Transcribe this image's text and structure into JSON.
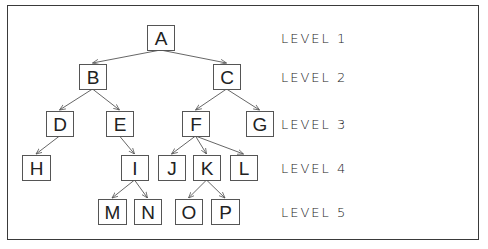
{
  "diagram": {
    "type": "tree",
    "nodes": [
      {
        "id": "A",
        "label": "A",
        "level": 1,
        "x": 147,
        "y": 25,
        "w": 27,
        "h": 25
      },
      {
        "id": "B",
        "label": "B",
        "level": 2,
        "x": 79,
        "y": 64,
        "w": 27,
        "h": 25
      },
      {
        "id": "C",
        "label": "C",
        "level": 2,
        "x": 213,
        "y": 64,
        "w": 27,
        "h": 25
      },
      {
        "id": "D",
        "label": "D",
        "level": 3,
        "x": 46,
        "y": 111,
        "w": 27,
        "h": 25
      },
      {
        "id": "E",
        "label": "E",
        "level": 3,
        "x": 106,
        "y": 111,
        "w": 27,
        "h": 25
      },
      {
        "id": "F",
        "label": "F",
        "level": 3,
        "x": 182,
        "y": 111,
        "w": 27,
        "h": 25
      },
      {
        "id": "G",
        "label": "G",
        "level": 3,
        "x": 246,
        "y": 111,
        "w": 27,
        "h": 25
      },
      {
        "id": "H",
        "label": "H",
        "level": 4,
        "x": 22,
        "y": 155,
        "w": 28,
        "h": 25
      },
      {
        "id": "I",
        "label": "I",
        "level": 4,
        "x": 121,
        "y": 155,
        "w": 27,
        "h": 25
      },
      {
        "id": "J",
        "label": "J",
        "level": 4,
        "x": 158,
        "y": 155,
        "w": 27,
        "h": 25
      },
      {
        "id": "K",
        "label": "K",
        "level": 4,
        "x": 193,
        "y": 155,
        "w": 27,
        "h": 25
      },
      {
        "id": "L",
        "label": "L",
        "level": 4,
        "x": 230,
        "y": 155,
        "w": 27,
        "h": 25
      },
      {
        "id": "M",
        "label": "M",
        "level": 5,
        "x": 98,
        "y": 199,
        "w": 28,
        "h": 25
      },
      {
        "id": "N",
        "label": "N",
        "level": 5,
        "x": 134,
        "y": 199,
        "w": 27,
        "h": 25
      },
      {
        "id": "O",
        "label": "O",
        "level": 5,
        "x": 175,
        "y": 199,
        "w": 27,
        "h": 25
      },
      {
        "id": "P",
        "label": "P",
        "level": 5,
        "x": 211,
        "y": 199,
        "w": 28,
        "h": 25
      }
    ],
    "edges": [
      {
        "from": "A",
        "to": "B"
      },
      {
        "from": "A",
        "to": "C"
      },
      {
        "from": "B",
        "to": "D"
      },
      {
        "from": "B",
        "to": "E"
      },
      {
        "from": "C",
        "to": "F"
      },
      {
        "from": "C",
        "to": "G"
      },
      {
        "from": "D",
        "to": "H"
      },
      {
        "from": "E",
        "to": "I"
      },
      {
        "from": "F",
        "to": "J"
      },
      {
        "from": "F",
        "to": "K"
      },
      {
        "from": "F",
        "to": "L"
      },
      {
        "from": "I",
        "to": "M"
      },
      {
        "from": "I",
        "to": "N"
      },
      {
        "from": "K",
        "to": "O"
      },
      {
        "from": "K",
        "to": "P"
      }
    ],
    "levels": [
      {
        "label": "LEVEL 1",
        "y": 38
      },
      {
        "label": "LEVEL 2",
        "y": 77
      },
      {
        "label": "LEVEL 3",
        "y": 124
      },
      {
        "label": "LEVEL 4",
        "y": 168
      },
      {
        "label": "LEVEL 5",
        "y": 212
      }
    ],
    "level_label_x": 281,
    "colors": {
      "stroke": "#555555",
      "text": "#222222",
      "background": "#ffffff",
      "frame": "#3a3a3a"
    }
  }
}
